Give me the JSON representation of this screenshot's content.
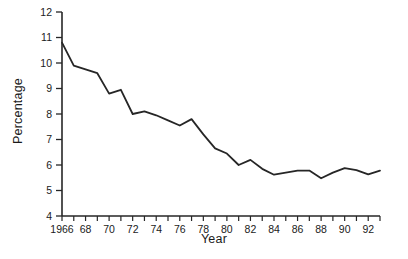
{
  "chart_data": {
    "type": "line",
    "title": "",
    "xlabel": "Year",
    "ylabel": "Percentage",
    "xlim": [
      1966,
      1993
    ],
    "ylim": [
      4,
      12
    ],
    "grid": false,
    "legend": null,
    "line_color": "#262626",
    "x_tick_labels": [
      "1966",
      "68",
      "70",
      "72",
      "74",
      "76",
      "78",
      "80",
      "82",
      "84",
      "86",
      "88",
      "90",
      "92"
    ],
    "x_tick_values": [
      1966,
      1968,
      1970,
      1972,
      1974,
      1976,
      1978,
      1980,
      1982,
      1984,
      1986,
      1988,
      1990,
      1992
    ],
    "x_minor_tick_values": [
      1967,
      1969,
      1971,
      1973,
      1975,
      1977,
      1979,
      1981,
      1983,
      1985,
      1987,
      1989,
      1991,
      1993
    ],
    "y_tick_labels": [
      "4",
      "5",
      "6",
      "7",
      "8",
      "9",
      "10",
      "11",
      "12"
    ],
    "y_tick_values": [
      4,
      5,
      6,
      7,
      8,
      9,
      10,
      11,
      12
    ],
    "x": [
      1966,
      1967,
      1968,
      1969,
      1970,
      1971,
      1972,
      1973,
      1974,
      1975,
      1976,
      1977,
      1978,
      1979,
      1980,
      1981,
      1982,
      1983,
      1984,
      1985,
      1986,
      1987,
      1988,
      1989,
      1990,
      1991,
      1992,
      1993
    ],
    "values": [
      10.8,
      9.9,
      9.75,
      9.6,
      8.8,
      8.95,
      8.0,
      8.1,
      7.95,
      7.75,
      7.55,
      7.8,
      7.2,
      6.65,
      6.45,
      6.0,
      6.2,
      5.85,
      5.62,
      5.7,
      5.78,
      5.78,
      5.48,
      5.7,
      5.88,
      5.8,
      5.63,
      5.78
    ],
    "series": [
      {
        "name": "Percentage",
        "values": [
          10.8,
          9.9,
          9.75,
          9.6,
          8.8,
          8.95,
          8.0,
          8.1,
          7.95,
          7.75,
          7.55,
          7.8,
          7.2,
          6.65,
          6.45,
          6.0,
          6.2,
          5.85,
          5.62,
          5.7,
          5.78,
          5.78,
          5.48,
          5.7,
          5.88,
          5.8,
          5.63,
          5.78
        ]
      }
    ]
  }
}
